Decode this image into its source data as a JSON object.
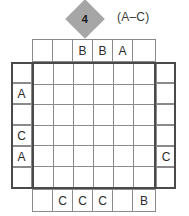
{
  "puzzle": {
    "marker": {
      "value": "4",
      "shape": "diamond",
      "color": "#a6a6a6",
      "above_column": 3
    },
    "range_label": "(A–C)",
    "grid": {
      "rows": 6,
      "columns": 6,
      "cells": [
        [
          "",
          "",
          "",
          "",
          "",
          ""
        ],
        [
          "",
          "",
          "",
          "",
          "",
          ""
        ],
        [
          "",
          "",
          "",
          "",
          "",
          ""
        ],
        [
          "",
          "",
          "",
          "",
          "",
          ""
        ],
        [
          "",
          "",
          "",
          "",
          "",
          ""
        ],
        [
          "",
          "",
          "",
          "",
          "",
          ""
        ]
      ]
    },
    "clues": {
      "top": [
        "",
        "",
        "B",
        "B",
        "A",
        ""
      ],
      "bottom": [
        "",
        "C",
        "C",
        "C",
        "",
        "B"
      ],
      "left": [
        "",
        "A",
        "",
        "C",
        "A",
        ""
      ],
      "right": [
        "",
        "",
        "",
        "",
        "C",
        ""
      ]
    }
  }
}
